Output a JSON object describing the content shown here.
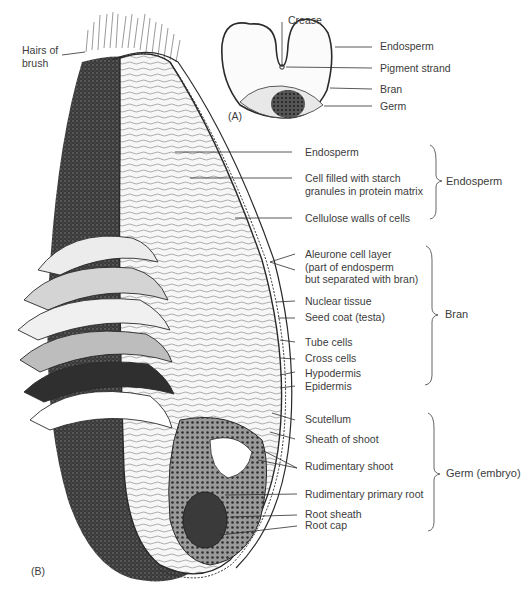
{
  "figure": {
    "panel_a_tag": "(A)",
    "panel_b_tag": "(B)"
  },
  "panel_a": {
    "labels": {
      "crease": "Crease",
      "endosperm": "Endosperm",
      "pigment_strand": "Pigment strand",
      "bran": "Bran",
      "germ": "Germ"
    }
  },
  "panel_b": {
    "hairs_of_brush": [
      "Hairs of",
      "brush"
    ],
    "endosperm_group": {
      "title": "Endosperm",
      "items": [
        [
          "Endosperm"
        ],
        [
          "Cell filled with starch",
          "granules in protein matrix"
        ],
        [
          "Cellulose walls of cells"
        ]
      ]
    },
    "bran_group": {
      "title": "Bran",
      "items": [
        [
          "Aleurone cell layer",
          "(part of endosperm",
          "but separated with bran)"
        ],
        [
          "Nuclear tissue"
        ],
        [
          "Seed coat (testa)"
        ],
        [
          "Tube cells"
        ],
        [
          "Cross cells"
        ],
        [
          "Hypodermis"
        ],
        [
          "Epidermis"
        ]
      ]
    },
    "germ_group": {
      "title": "Germ (embryo)",
      "items": [
        [
          "Scutellum"
        ],
        [
          "Sheath of shoot"
        ],
        [
          "Rudimentary shoot"
        ],
        [
          "Rudimentary primary root"
        ],
        [
          "Root sheath"
        ],
        [
          "Root cap"
        ]
      ]
    }
  },
  "colors": {
    "ink": "#2a2a2a",
    "dark_fill": "#3b3b3b",
    "light_fill": "#f2f2f2",
    "text": "#3c3c3c"
  }
}
